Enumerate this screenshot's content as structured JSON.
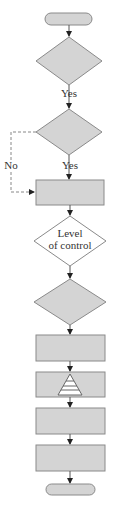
{
  "diagram": {
    "type": "flowchart",
    "colors": {
      "shape_fill": "#d4d4d4",
      "shape_stroke": "#8a8a8a",
      "white_fill": "#ffffff",
      "line": "#555555"
    },
    "nodes": [
      {
        "id": "start",
        "shape": "terminator",
        "label": ""
      },
      {
        "id": "decision1",
        "shape": "diamond",
        "label": ""
      },
      {
        "id": "decision2",
        "shape": "diamond",
        "label": ""
      },
      {
        "id": "process1",
        "shape": "rectangle",
        "label": ""
      },
      {
        "id": "decision-level",
        "shape": "diamond",
        "label": "Level of control",
        "label_line1": "Level",
        "label_line2": "of control"
      },
      {
        "id": "decision3",
        "shape": "diamond",
        "label": ""
      },
      {
        "id": "process2",
        "shape": "rectangle",
        "label": ""
      },
      {
        "id": "process-pyramid",
        "shape": "rectangle",
        "label": "",
        "icon": "pyramid-icon"
      },
      {
        "id": "process3",
        "shape": "rectangle",
        "label": ""
      },
      {
        "id": "process4",
        "shape": "rectangle",
        "label": ""
      },
      {
        "id": "end",
        "shape": "terminator",
        "label": ""
      }
    ],
    "edges": [
      {
        "from": "start",
        "to": "decision1",
        "label": ""
      },
      {
        "from": "decision1",
        "to": "decision2",
        "label": "Yes"
      },
      {
        "from": "decision2",
        "to": "process1",
        "label": "Yes"
      },
      {
        "from": "decision2",
        "to": "process1",
        "label": "No",
        "style": "dashed"
      },
      {
        "from": "process1",
        "to": "decision-level",
        "label": ""
      },
      {
        "from": "decision-level",
        "to": "decision3",
        "label": ""
      },
      {
        "from": "decision3",
        "to": "process2",
        "label": ""
      },
      {
        "from": "process2",
        "to": "process-pyramid",
        "label": ""
      },
      {
        "from": "process-pyramid",
        "to": "process3",
        "label": ""
      },
      {
        "from": "process3",
        "to": "process4",
        "label": ""
      },
      {
        "from": "process4",
        "to": "end",
        "label": ""
      }
    ],
    "labels": {
      "yes1": "Yes",
      "yes2": "Yes",
      "no": "No"
    }
  }
}
